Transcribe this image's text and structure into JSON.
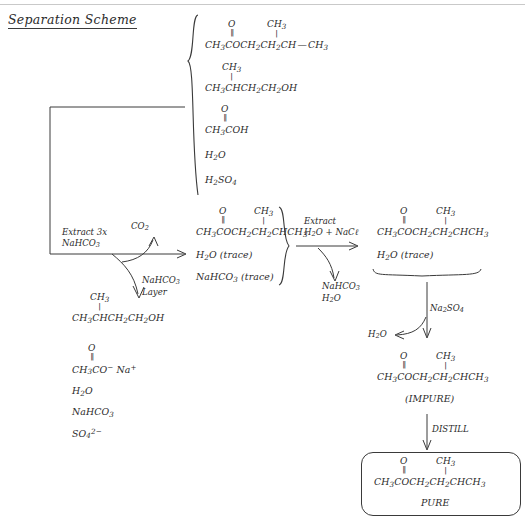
{
  "title": "Separation Scheme",
  "mixtures": {
    "starting": {
      "name": "starting-mixture",
      "items": [
        {
          "carbonyl_o": "O",
          "dbl": "‖",
          "chain": "CH3COCH2CH2CH",
          "branch_top": "CH3",
          "tail": "CH3"
        },
        {
          "branch_top": "CH3",
          "chain": "CH3CHCH2CH2OH"
        },
        {
          "carbonyl_o": "O",
          "dbl": "‖",
          "chain": "CH3COH"
        },
        {
          "chain": "H2O"
        },
        {
          "chain": "H2SO4"
        }
      ]
    },
    "organic_after_bicarb": {
      "name": "organic-layer-after-bicarbonate",
      "items": [
        {
          "carbonyl_o": "O",
          "dbl": "‖",
          "chain": "CH3COCH2CH2CHCH3",
          "branch_top": "CH3"
        },
        {
          "chain": "H2O (trace)"
        },
        {
          "chain": "NaHCO3 (trace)"
        }
      ]
    },
    "organic_after_brine": {
      "name": "organic-layer-after-brine",
      "items": [
        {
          "carbonyl_o": "O",
          "dbl": "‖",
          "chain": "CH3COCH2CH2CHCH3",
          "branch_top": "CH3"
        },
        {
          "chain": "H2O (trace)"
        }
      ]
    },
    "bicarb_layer": {
      "name": "bicarbonate-layer-contents",
      "items": [
        {
          "branch_top": "CH3",
          "chain": "CH3CHCH2CH2OH"
        },
        {
          "carbonyl_o": "O",
          "dbl": "‖",
          "chain": "CH3CO− Na+"
        },
        {
          "chain": "H2O"
        },
        {
          "chain": "NaHCO3"
        },
        {
          "chain": "SO4 2−"
        }
      ]
    }
  },
  "steps": {
    "extract_bicarb": {
      "line1": "Extract 3x",
      "line2": "NaHCO3"
    },
    "gas_evolved": "CO2",
    "bicarb_layer_label": {
      "line1": "NaHCO3",
      "line2": "Layer"
    },
    "extract_brine": {
      "line1": "Extract",
      "line2": "H2O + NaCl"
    },
    "aqueous_waste": {
      "line1": "NaHCO3",
      "line2": "H2O"
    },
    "drying_agent": "Na2SO4",
    "water_removed": "H2O",
    "distill": "DISTILL"
  },
  "products": {
    "impure": {
      "label": "(IMPURE)",
      "structure": {
        "carbonyl_o": "O",
        "dbl": "‖",
        "chain": "CH3COCH2CH2CHCH3",
        "branch_top": "CH3"
      }
    },
    "pure": {
      "label": "PURE",
      "structure": {
        "carbonyl_o": "O",
        "dbl": "‖",
        "chain": "CH3COCH2CH2CHCH3",
        "branch_top": "CH3"
      }
    }
  },
  "colors": {
    "ink": "#3a3a3a",
    "paper": "#ffffff",
    "rule": "#c9c9c9"
  }
}
